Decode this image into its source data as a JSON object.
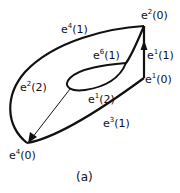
{
  "diagram": {
    "caption": "(a)",
    "labels": {
      "e2_0": {
        "base": "e",
        "sup": "2",
        "arg": "(0)"
      },
      "e1_1": {
        "base": "e",
        "sup": "1",
        "arg": "(1)"
      },
      "e1_0": {
        "base": "e",
        "sup": "1",
        "arg": "(0)"
      },
      "e4_1": {
        "base": "e",
        "sup": "4",
        "arg": "(1)"
      },
      "e6_1": {
        "base": "e",
        "sup": "6",
        "arg": "(1)"
      },
      "e2_2": {
        "base": "e",
        "sup": "2",
        "arg": "(2)"
      },
      "e1_2": {
        "base": "e",
        "sup": "1",
        "arg": "(2)"
      },
      "e3_1": {
        "base": "e",
        "sup": "3",
        "arg": "(1)"
      },
      "e4_0": {
        "base": "e",
        "sup": "4",
        "arg": "(0)"
      }
    },
    "stroke_color": "#111111"
  }
}
